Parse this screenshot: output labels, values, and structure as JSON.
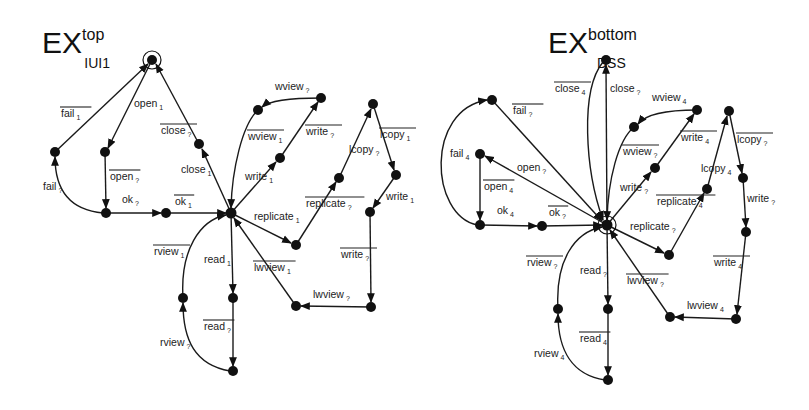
{
  "diagrams": [
    {
      "title": {
        "base": "EX",
        "sup": "top",
        "sub": "IUI1"
      },
      "nodes": {
        "init": [
          152,
          60
        ],
        "fail": [
          55,
          152
        ],
        "open": [
          105,
          152
        ],
        "close": [
          199,
          144
        ],
        "ok": [
          106,
          213
        ],
        "ok1": [
          166,
          213
        ],
        "hub": [
          231,
          213
        ],
        "wviewMid": [
          258,
          110
        ],
        "wviewTop": [
          321,
          98
        ],
        "writeMid": [
          280,
          158
        ],
        "repl": [
          296,
          245
        ],
        "replMid": [
          339,
          178
        ],
        "lcopyTop": [
          373,
          104
        ],
        "lcopyR": [
          396,
          175
        ],
        "writeR": [
          370,
          212
        ],
        "lwR": [
          371,
          307
        ],
        "lw": [
          296,
          306
        ],
        "read": [
          233,
          298
        ],
        "rview": [
          183,
          298
        ],
        "bottom": [
          233,
          371
        ]
      },
      "labels": [
        {
          "text": "fail",
          "sub": "1",
          "x": 61,
          "y": 117,
          "overline": true
        },
        {
          "text": "open",
          "sub": "1",
          "x": 134,
          "y": 107,
          "overline": false
        },
        {
          "text": "close",
          "sub": "?",
          "x": 161,
          "y": 134,
          "overline": true
        },
        {
          "text": "close",
          "sub": "1",
          "x": 181,
          "y": 173,
          "overline": false
        },
        {
          "text": "open",
          "sub": "?",
          "x": 110,
          "y": 180,
          "overline": true
        },
        {
          "text": "fail",
          "sub": "?",
          "x": 43,
          "y": 190,
          "overline": false
        },
        {
          "text": "ok",
          "sub": "?",
          "x": 122,
          "y": 203,
          "overline": false
        },
        {
          "text": "ok",
          "sub": "1",
          "x": 175,
          "y": 205,
          "overline": true
        },
        {
          "text": "wview",
          "sub": "?",
          "x": 275,
          "y": 90,
          "overline": false
        },
        {
          "text": "wview",
          "sub": "1",
          "x": 248,
          "y": 140,
          "overline": true
        },
        {
          "text": "write",
          "sub": "?",
          "x": 306,
          "y": 135,
          "overline": true
        },
        {
          "text": "write",
          "sub": "1",
          "x": 245,
          "y": 180,
          "overline": false
        },
        {
          "text": "lcopy",
          "sub": "?",
          "x": 349,
          "y": 153,
          "overline": false
        },
        {
          "text": "lcopy",
          "sub": "1",
          "x": 380,
          "y": 138,
          "overline": true
        },
        {
          "text": "replicate",
          "sub": "1",
          "x": 254,
          "y": 220,
          "overline": false
        },
        {
          "text": "replicate",
          "sub": "?",
          "x": 306,
          "y": 207,
          "overline": true
        },
        {
          "text": "write",
          "sub": "1",
          "x": 386,
          "y": 200,
          "overline": false
        },
        {
          "text": "rview",
          "sub": "1",
          "x": 154,
          "y": 255,
          "overline": true
        },
        {
          "text": "read",
          "sub": "1",
          "x": 204,
          "y": 263,
          "overline": false
        },
        {
          "text": "lwview",
          "sub": "1",
          "x": 254,
          "y": 271,
          "overline": true
        },
        {
          "text": "write",
          "sub": "?",
          "x": 341,
          "y": 258,
          "overline": true
        },
        {
          "text": "lwview",
          "sub": "?",
          "x": 313,
          "y": 298,
          "overline": false
        },
        {
          "text": "read",
          "sub": "?",
          "x": 204,
          "y": 330,
          "overline": true
        },
        {
          "text": "rview",
          "sub": "?",
          "x": 160,
          "y": 346,
          "overline": false
        }
      ]
    },
    {
      "title": {
        "base": "EX",
        "sup": "bottom",
        "sub": "DSS"
      },
      "nodes": {
        "closeTop": [
          606,
          60
        ],
        "failTop": [
          492,
          100
        ],
        "fail4": [
          480,
          154
        ],
        "ok4": [
          480,
          225
        ],
        "ok": [
          542,
          226
        ],
        "hub": [
          607,
          225
        ],
        "wviewMid": [
          634,
          127
        ],
        "wviewTop": [
          697,
          110
        ],
        "writeMid": [
          655,
          168
        ],
        "repl": [
          669,
          255
        ],
        "replMid": [
          707,
          189
        ],
        "lcopyTop": [
          729,
          111
        ],
        "lcopyMid": [
          743,
          178
        ],
        "writeR": [
          746,
          232
        ],
        "lwR": [
          736,
          319
        ],
        "lw": [
          670,
          317
        ],
        "read": [
          608,
          309
        ],
        "rview": [
          558,
          309
        ],
        "bottom": [
          608,
          380
        ]
      },
      "labels": [
        {
          "text": "close",
          "sub": "4",
          "x": 555,
          "y": 92,
          "overline": true
        },
        {
          "text": "close",
          "sub": "?",
          "x": 610,
          "y": 92,
          "overline": false
        },
        {
          "text": "fail",
          "sub": "?",
          "x": 513,
          "y": 114,
          "overline": true
        },
        {
          "text": "wview",
          "sub": "4",
          "x": 652,
          "y": 101,
          "overline": false
        },
        {
          "text": "wview",
          "sub": "?",
          "x": 623,
          "y": 155,
          "overline": true
        },
        {
          "text": "write",
          "sub": "4",
          "x": 681,
          "y": 141,
          "overline": true
        },
        {
          "text": "lcopy",
          "sub": "?",
          "x": 737,
          "y": 143,
          "overline": true
        },
        {
          "text": "fail",
          "sub": "4",
          "x": 450,
          "y": 157,
          "overline": false
        },
        {
          "text": "open",
          "sub": "?",
          "x": 517,
          "y": 171,
          "overline": false
        },
        {
          "text": "write",
          "sub": "?",
          "x": 620,
          "y": 191,
          "overline": false
        },
        {
          "text": "lcopy",
          "sub": "4",
          "x": 701,
          "y": 172,
          "overline": false
        },
        {
          "text": "open",
          "sub": "4",
          "x": 484,
          "y": 190,
          "overline": true
        },
        {
          "text": "replicate",
          "sub": "4",
          "x": 657,
          "y": 205,
          "overline": true
        },
        {
          "text": "write",
          "sub": "?",
          "x": 747,
          "y": 202,
          "overline": false
        },
        {
          "text": "ok",
          "sub": "4",
          "x": 497,
          "y": 214,
          "overline": false
        },
        {
          "text": "ok",
          "sub": "?",
          "x": 549,
          "y": 216,
          "overline": true
        },
        {
          "text": "replicate",
          "sub": "?",
          "x": 630,
          "y": 230,
          "overline": false
        },
        {
          "text": "rview",
          "sub": "?",
          "x": 527,
          "y": 266,
          "overline": true
        },
        {
          "text": "read",
          "sub": "?",
          "x": 580,
          "y": 274,
          "overline": false
        },
        {
          "text": "lwview",
          "sub": "?",
          "x": 627,
          "y": 284,
          "overline": true
        },
        {
          "text": "write",
          "sub": "4",
          "x": 714,
          "y": 266,
          "overline": true
        },
        {
          "text": "lwview",
          "sub": "4",
          "x": 687,
          "y": 309,
          "overline": false
        },
        {
          "text": "read",
          "sub": "4",
          "x": 580,
          "y": 342,
          "overline": true
        },
        {
          "text": "rview",
          "sub": "4",
          "x": 534,
          "y": 357,
          "overline": false
        }
      ]
    }
  ]
}
